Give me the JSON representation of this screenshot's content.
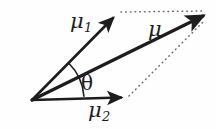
{
  "figure": {
    "name": "vector-decomposition-diagram",
    "background_color": "#fefefe",
    "stroke_color": "#1d1d1d",
    "dotted_color": "#6b6b6b",
    "width": 216,
    "height": 129
  },
  "labels": {
    "mu1": {
      "base": "μ",
      "sub": "1"
    },
    "mu2": {
      "base": "μ",
      "sub": "2"
    },
    "mu": {
      "base": "μ",
      "sub": ""
    },
    "theta": "θ"
  },
  "geometry": {
    "origin": {
      "x": 32,
      "y": 100
    },
    "vectors": [
      {
        "name": "mu1",
        "x1": 32,
        "y1": 100,
        "x2": 117,
        "y2": 14,
        "style": "solid",
        "arrow": true
      },
      {
        "name": "mu2",
        "x1": 32,
        "y1": 100,
        "x2": 125,
        "y2": 97,
        "style": "solid",
        "arrow": true
      },
      {
        "name": "mu",
        "x1": 32,
        "y1": 100,
        "x2": 207,
        "y2": 14,
        "style": "solid",
        "arrow": true
      }
    ],
    "construction_lines": [
      {
        "name": "mu1-to-mu-tip",
        "x1": 120,
        "y1": 12,
        "x2": 203,
        "y2": 11,
        "style": "dotted"
      },
      {
        "name": "mu2-to-mu-tip",
        "x1": 128,
        "y1": 96,
        "x2": 204,
        "y2": 18,
        "style": "dotted"
      }
    ],
    "angle_arc": {
      "name": "theta-arc",
      "center": {
        "x": 32,
        "y": 100
      },
      "radius": 52,
      "from_deg": 45.3,
      "to_deg": 1.8
    }
  }
}
